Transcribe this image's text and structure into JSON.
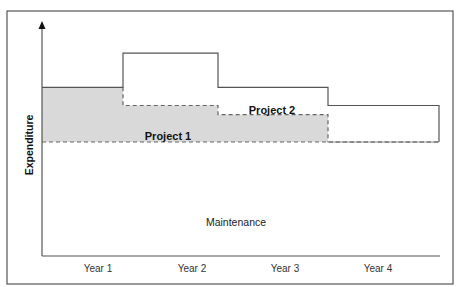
{
  "chart_data": {
    "type": "area",
    "title": "",
    "xlabel": "",
    "ylabel": "Expenditure",
    "categories": [
      "Year 1",
      "Year 2",
      "Year 3",
      "Year 4"
    ],
    "ylim": [
      0,
      100
    ],
    "y_ticks_shown": false,
    "grid": false,
    "legend": "inline labels",
    "series": [
      {
        "name": "Maintenance",
        "style": "white area below dashed baseline",
        "values": [
          50,
          50,
          50,
          50
        ]
      },
      {
        "name": "Project 1",
        "style": "gray fill, stacked on Maintenance",
        "values": [
          24,
          16,
          12,
          0
        ]
      },
      {
        "name": "Project 2",
        "style": "outline, stacked on Project 1",
        "values": [
          0,
          23,
          12,
          16
        ]
      }
    ],
    "totals": [
      74,
      89,
      74,
      66
    ],
    "annotations": [
      "Project 1",
      "Project 2",
      "Maintenance"
    ]
  },
  "labels": {
    "ylabel": "Expenditure",
    "project1": "Project 1",
    "project2": "Project 2",
    "maintenance": "Maintenance",
    "years": [
      "Year 1",
      "Year 2",
      "Year 3",
      "Year 4"
    ]
  },
  "colors": {
    "project1_fill": "#d9d9d9",
    "lines": "#555555",
    "text": "#222222"
  }
}
